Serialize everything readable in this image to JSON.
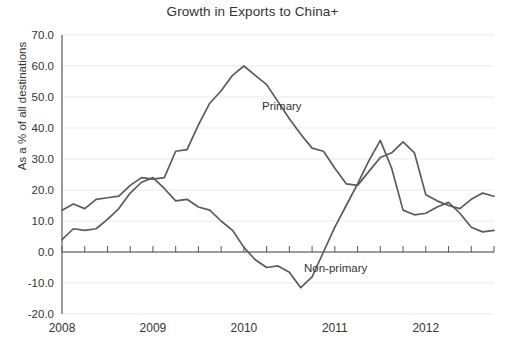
{
  "chart_data": {
    "type": "line",
    "title": "Growth in Exports to China+",
    "xlabel": "",
    "ylabel": "As a % of all destinations",
    "ylim": [
      -20.0,
      70.0
    ],
    "ytick_labels": [
      "70.0",
      "60.0",
      "50.0",
      "40.0",
      "30.0",
      "20.0",
      "10.0",
      "0.0",
      "-10.0",
      "-20.0"
    ],
    "ytick_values": [
      70,
      60,
      50,
      40,
      30,
      20,
      10,
      0,
      -10,
      -20
    ],
    "xtick_labels": [
      "2008",
      "2009",
      "2010",
      "2011",
      "2012"
    ],
    "xtick_values": [
      2008,
      2009,
      2010,
      2011,
      2012
    ],
    "xlim": [
      2008.0,
      2012.75
    ],
    "grid": true,
    "legend_position": "inline-annotations",
    "x": [
      2008.0,
      2008.125,
      2008.25,
      2008.375,
      2008.5,
      2008.625,
      2008.75,
      2008.875,
      2009.0,
      2009.125,
      2009.25,
      2009.375,
      2009.5,
      2009.625,
      2009.75,
      2009.875,
      2010.0,
      2010.125,
      2010.25,
      2010.375,
      2010.5,
      2010.625,
      2010.75,
      2010.875,
      2011.0,
      2011.125,
      2011.25,
      2011.375,
      2011.5,
      2011.625,
      2011.75,
      2011.875,
      2012.0,
      2012.125,
      2012.25,
      2012.375,
      2012.5,
      2012.625,
      2012.75
    ],
    "series": [
      {
        "name": "Primary",
        "annotation": "Primary",
        "color": "#5b5b5b",
        "values": [
          13.5,
          15.5,
          14.0,
          17.0,
          17.5,
          18.0,
          21.5,
          24.0,
          23.5,
          24.0,
          32.5,
          33.0,
          41.0,
          48.0,
          52.0,
          57.0,
          60.0,
          57.0,
          54.0,
          48.5,
          43.0,
          38.0,
          33.5,
          32.5,
          27.0,
          22.0,
          21.5,
          26.0,
          30.5,
          32.0,
          35.5,
          32.0,
          18.5,
          16.5,
          15.0,
          14.0,
          17.0,
          19.0,
          18.0
        ]
      },
      {
        "name": "Non-primary",
        "annotation": "Non-primary",
        "color": "#5b5b5b",
        "values": [
          4.0,
          7.5,
          7.0,
          7.5,
          10.5,
          14.0,
          19.0,
          22.5,
          24.0,
          20.5,
          16.5,
          17.0,
          14.5,
          13.5,
          10.0,
          7.0,
          1.5,
          -2.5,
          -5.0,
          -4.5,
          -6.5,
          -11.5,
          -8.0,
          0.0,
          8.0,
          15.0,
          22.0,
          29.5,
          36.0,
          27.0,
          13.5,
          12.0,
          12.5,
          14.5,
          16.0,
          12.5,
          8.0,
          6.5,
          7.0
        ]
      }
    ],
    "annotations": [
      {
        "text": "Primary",
        "x_px": 262,
        "y_px": 110
      },
      {
        "text": "Non-primary",
        "x_px": 304,
        "y_px": 272
      }
    ]
  },
  "meta": {
    "plot_left_px": 62,
    "plot_right_px": 494,
    "plot_top_px": 35,
    "plot_bottom_px": 314
  }
}
